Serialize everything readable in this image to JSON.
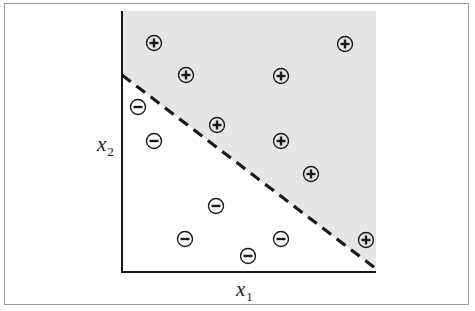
{
  "chart_data": {
    "type": "scatter",
    "title": "",
    "xlabel": "x1",
    "ylabel": "x2",
    "xlabel_main": "x",
    "xlabel_sub": "1",
    "ylabel_main": "x",
    "ylabel_sub": "2",
    "grid": false,
    "ticks": false,
    "legend": null,
    "coordinate_space": "pixel",
    "plot_area": {
      "x0": 122,
      "y0": 11,
      "x1": 376,
      "y1": 272
    },
    "decision_boundary": {
      "style": "dashed",
      "from": [
        122,
        75
      ],
      "to": [
        375,
        268
      ],
      "description": "Linear separator; positive region (shaded gray) above-right, negative region (white) below-left"
    },
    "regions": [
      {
        "label": "positive",
        "fill": "#e6e6e6"
      },
      {
        "label": "negative",
        "fill": "#ffffff"
      }
    ],
    "series": [
      {
        "name": "positive",
        "symbol": "+",
        "points": [
          [
            154,
            43
          ],
          [
            186,
            75
          ],
          [
            281,
            76
          ],
          [
            345,
            44
          ],
          [
            217,
            125
          ],
          [
            281,
            141
          ],
          [
            311,
            174
          ],
          [
            366,
            240
          ]
        ]
      },
      {
        "name": "negative",
        "symbol": "−",
        "points": [
          [
            138,
            107
          ],
          [
            154,
            141
          ],
          [
            216,
            206
          ],
          [
            185,
            239
          ],
          [
            248,
            256
          ],
          [
            281,
            239
          ]
        ]
      }
    ]
  },
  "colors": {
    "shade": "#e6e6e6",
    "ink": "#1a1a1a",
    "frame": "#9a9a9a"
  }
}
